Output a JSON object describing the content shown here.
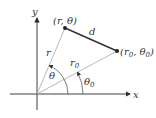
{
  "diagram": {
    "axes": {
      "x_label": "x",
      "y_label": "y"
    },
    "points": [
      {
        "name": "P",
        "label": "(r, θ)"
      },
      {
        "name": "P0",
        "label_main": "(r",
        "label_sub": "0",
        "label_mid": ", θ",
        "label_sub2": "0",
        "label_end": ")"
      }
    ],
    "segments": {
      "distance_label": "d",
      "r_label": "r",
      "r0_label": "r",
      "r0_sub": "0"
    },
    "angles": {
      "theta_label": "θ",
      "theta0_label": "θ",
      "theta0_sub": "0"
    },
    "colors": {
      "axis": "#2b2b2b",
      "radial": "#b0b0b0",
      "segment": "#333333",
      "text": "#333333"
    }
  }
}
